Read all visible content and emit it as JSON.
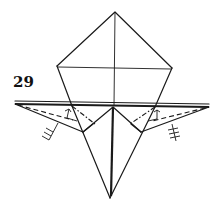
{
  "diagram": {
    "step_number": "29",
    "type": "origami-fold-step",
    "colors": {
      "line": "#1a1a1a",
      "background": "#ffffff"
    },
    "annotations": [
      {
        "name": "left-valley-fold",
        "style": "dashed"
      },
      {
        "name": "left-mountain-fold",
        "style": "dash-dot"
      },
      {
        "name": "right-valley-fold",
        "style": "dashed"
      },
      {
        "name": "right-mountain-fold",
        "style": "dash-dot"
      },
      {
        "name": "left-repeat-marks",
        "count": 3
      },
      {
        "name": "right-repeat-marks",
        "count": 3
      }
    ]
  }
}
